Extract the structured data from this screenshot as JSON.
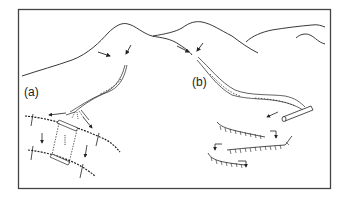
{
  "figure": {
    "panels": [
      {
        "id": "a",
        "label": "(a)"
      },
      {
        "id": "b",
        "label": "(b)"
      }
    ],
    "colors": {
      "ink": "#222222",
      "frame": "#444444",
      "background": "#ffffff"
    }
  }
}
